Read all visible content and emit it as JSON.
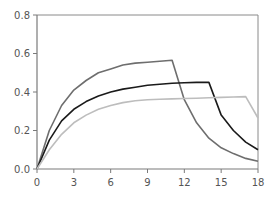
{
  "chart_data": {
    "type": "line",
    "title": "",
    "xlabel": "",
    "ylabel": "",
    "xlim": [
      0,
      18
    ],
    "ylim": [
      0,
      0.8
    ],
    "xticks": [
      0,
      3,
      6,
      9,
      12,
      15,
      18
    ],
    "yticks": [
      0.0,
      0.2,
      0.4,
      0.6,
      0.8
    ],
    "xtick_labels": [
      "0",
      "3",
      "6",
      "9",
      "12",
      "15",
      "18"
    ],
    "ytick_labels": [
      "0.0",
      "0.2",
      "0.4",
      "0.6",
      "0.8"
    ],
    "grid": false,
    "legend": null,
    "series": [
      {
        "name": "dark-gray",
        "color": "#6e6e6e",
        "x": [
          0,
          1,
          2,
          3,
          4,
          5,
          6,
          7,
          8,
          9,
          10,
          11,
          12,
          13,
          14,
          15,
          16,
          17,
          18
        ],
        "y": [
          0.0,
          0.2,
          0.33,
          0.41,
          0.46,
          0.5,
          0.52,
          0.54,
          0.55,
          0.555,
          0.56,
          0.565,
          0.36,
          0.24,
          0.16,
          0.11,
          0.08,
          0.055,
          0.04
        ]
      },
      {
        "name": "black",
        "color": "#1a1a1a",
        "x": [
          0,
          1,
          2,
          3,
          4,
          5,
          6,
          7,
          8,
          9,
          10,
          11,
          12,
          13,
          14,
          15,
          16,
          17,
          18
        ],
        "y": [
          0.0,
          0.15,
          0.25,
          0.31,
          0.35,
          0.38,
          0.4,
          0.415,
          0.425,
          0.435,
          0.44,
          0.445,
          0.448,
          0.45,
          0.45,
          0.28,
          0.2,
          0.14,
          0.1
        ]
      },
      {
        "name": "light-gray",
        "color": "#bdbdbd",
        "x": [
          0,
          1,
          2,
          3,
          4,
          5,
          6,
          7,
          8,
          9,
          10,
          11,
          12,
          13,
          14,
          15,
          16,
          17,
          18
        ],
        "y": [
          0.0,
          0.1,
          0.18,
          0.24,
          0.28,
          0.31,
          0.33,
          0.345,
          0.355,
          0.36,
          0.362,
          0.364,
          0.366,
          0.368,
          0.37,
          0.372,
          0.374,
          0.376,
          0.265
        ]
      }
    ]
  },
  "plot": {
    "left": 37,
    "right": 258,
    "top": 15,
    "bottom": 169
  }
}
